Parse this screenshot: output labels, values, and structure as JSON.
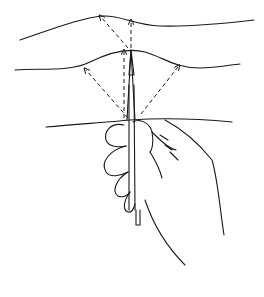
{
  "illustration": {
    "subject": "hand holding pencil vertically with dashed sight lines to horizon curves",
    "stroke_color": "#1a1a1a",
    "background": "#ffffff"
  }
}
